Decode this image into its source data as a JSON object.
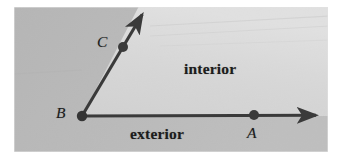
{
  "figure": {
    "canvas": {
      "width": 337,
      "height": 162
    },
    "colors": {
      "page_background": "#ffffff",
      "exterior_fill": "#b6b6b6",
      "interior_fill": "#d9d9d9",
      "ray_stroke": "#3a3a3a",
      "point_fill": "#3a3a3a",
      "label_text": "#1c1c1c"
    },
    "plate": {
      "x": 14,
      "y": 7,
      "width": 314,
      "height": 145
    }
  },
  "labels": {
    "vertex_b": "B",
    "point_c": "C",
    "point_a": "A",
    "interior": "interior",
    "exterior": "exterior"
  },
  "geometry": {
    "vertex": {
      "name": "B",
      "x": 82,
      "y": 116
    },
    "points": [
      {
        "name": "C",
        "x": 123,
        "y": 47,
        "radius": 5
      },
      {
        "name": "A",
        "x": 254,
        "y": 115,
        "radius": 5
      }
    ],
    "rays": [
      {
        "name": "ray-BA",
        "from": {
          "x": 82,
          "y": 116
        },
        "to": {
          "x": 322,
          "y": 115
        },
        "arrowhead": true
      },
      {
        "name": "ray-BC",
        "from": {
          "x": 82,
          "y": 116
        },
        "to": {
          "x": 146,
          "y": 8
        },
        "arrowhead": true
      }
    ],
    "angle_degrees": 59
  }
}
